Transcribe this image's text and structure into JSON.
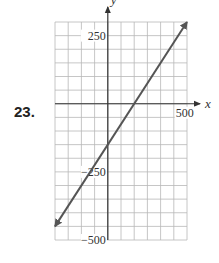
{
  "problem": {
    "number": "23."
  },
  "chart_data": {
    "type": "line",
    "title": "",
    "xlabel": "x",
    "ylabel": "y",
    "xlim": [
      -400,
      600
    ],
    "ylim": [
      -500,
      300
    ],
    "x_grid_step": 100,
    "y_grid_step": 50,
    "grid": true,
    "tick_labels": {
      "x": [
        {
          "value": 500,
          "label": "500"
        }
      ],
      "y": [
        {
          "value": 250,
          "label": "250"
        },
        {
          "value": -250,
          "label": "-250"
        },
        {
          "value": -500,
          "label": "-500"
        }
      ]
    },
    "series": [
      {
        "name": "line",
        "equation": "y = 0.75x - 150",
        "x": [
          -400,
          0,
          200,
          600
        ],
        "y": [
          -450,
          -150,
          0,
          300
        ],
        "arrows": "both"
      }
    ],
    "colors": {
      "grid": "#b8b8b8",
      "axis": "#333333",
      "line": "#555555"
    }
  }
}
